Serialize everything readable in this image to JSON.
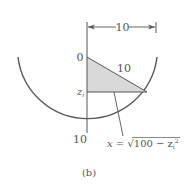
{
  "figure": {
    "caption": "(b)",
    "dimension_label": "10",
    "hypotenuse_label": "10",
    "axis_top_label": "0",
    "axis_z_label": "z",
    "axis_z_subscript": "i",
    "axis_bottom_label": "10",
    "formula": {
      "lhs": "x = ",
      "radical": "√",
      "radicand": "100 − z",
      "radicand_sub": "i",
      "radicand_sup": "2"
    },
    "colors": {
      "stroke": "#555555",
      "fill": "#d9d9d9",
      "text": "#555555"
    }
  }
}
